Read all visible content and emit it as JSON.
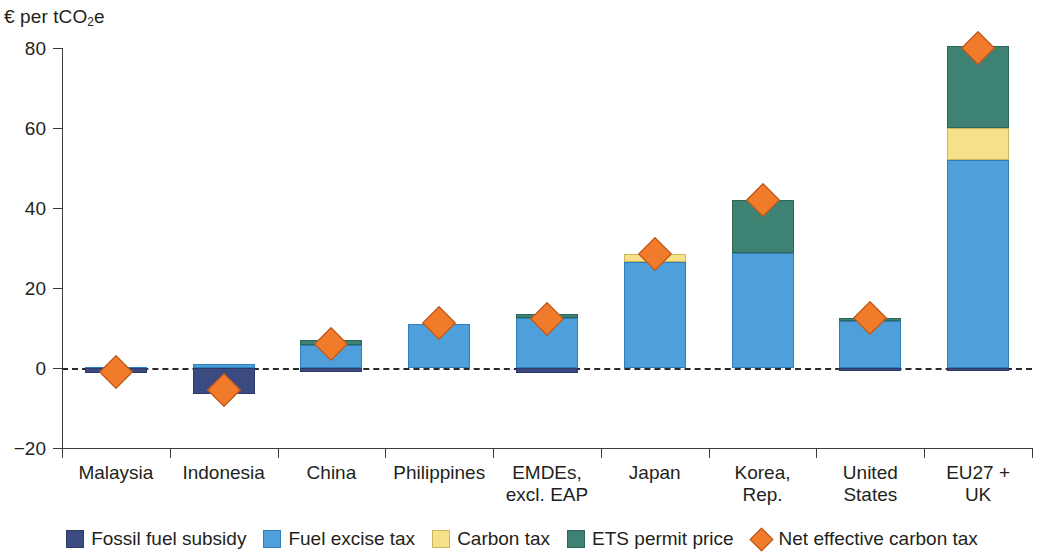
{
  "chart_data": {
    "type": "bar",
    "stacked": true,
    "title": "",
    "subtitle": "",
    "xlabel": "",
    "ylabel": "€ per tCO₂e",
    "ylabel_plain": "euro per tCO2e",
    "ylim": [
      -20,
      80
    ],
    "yticks": [
      80,
      60,
      40,
      20,
      0,
      -20
    ],
    "ytick_labels": [
      "80",
      "60",
      "40",
      "20",
      "0",
      "−20"
    ],
    "grid": false,
    "zero_line": true,
    "legend_position": "bottom",
    "categories": [
      "Malaysia",
      "Indonesia",
      "China",
      "Philippines",
      "EMDEs, excl. EAP",
      "Japan",
      "Korea, Rep.",
      "United States",
      "EU27 + UK"
    ],
    "category_label_lines": [
      [
        "Malaysia"
      ],
      [
        "Indonesia"
      ],
      [
        "China"
      ],
      [
        "Philippines"
      ],
      [
        "EMDEs,",
        "excl. EAP"
      ],
      [
        "Japan"
      ],
      [
        "Korea,",
        "Rep."
      ],
      [
        "United",
        "States"
      ],
      [
        "EU27 +",
        "UK"
      ]
    ],
    "series": [
      {
        "name": "Fossil fuel subsidy",
        "color": "#3b4a80",
        "values": [
          -1.2,
          -6.6,
          -1.0,
          0.0,
          -1.2,
          0.0,
          0.0,
          -0.2,
          -0.6
        ]
      },
      {
        "name": "Fuel excise tax",
        "color": "#4f9fdb",
        "values": [
          0.3,
          1.1,
          5.8,
          11.0,
          12.4,
          26.5,
          28.8,
          11.8,
          52.0
        ]
      },
      {
        "name": "Carbon tax",
        "color": "#f6e189",
        "values": [
          0.0,
          0.0,
          0.0,
          0.0,
          0.0,
          2.0,
          0.0,
          0.0,
          8.0
        ]
      },
      {
        "name": "ETS permit price",
        "color": "#3d8272",
        "values": [
          0.0,
          0.0,
          1.3,
          0.0,
          1.1,
          0.0,
          13.2,
          0.7,
          20.5
        ]
      }
    ],
    "marker_series": {
      "name": "Net effective carbon tax",
      "color": "#f07b2a",
      "marker": "diamond",
      "values": [
        -1.0,
        -5.6,
        6.0,
        11.2,
        12.2,
        28.5,
        42.0,
        12.5,
        80.1
      ]
    }
  },
  "legend": {
    "items": [
      {
        "label": "Fossil fuel subsidy",
        "swatch": "subsidy"
      },
      {
        "label": "Fuel excise tax",
        "swatch": "excise"
      },
      {
        "label": "Carbon tax",
        "swatch": "carbon"
      },
      {
        "label": "ETS permit price",
        "swatch": "ets"
      },
      {
        "label": "Net effective carbon tax",
        "swatch": "diamond"
      }
    ]
  },
  "icons": {
    "diamond_marker": "diamond-marker-icon"
  }
}
